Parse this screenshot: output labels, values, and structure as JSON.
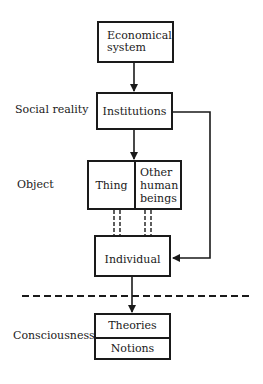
{
  "diagram": {
    "layers": {
      "social_reality": "Social reality",
      "object": "Object",
      "consciousness": "Consciousness"
    },
    "nodes": {
      "economical_system": [
        "Economical",
        "system"
      ],
      "institutions": "Institutions",
      "thing": "Thing",
      "other_human_beings": [
        "Other",
        "human",
        "beings"
      ],
      "individual": "Individual",
      "theories": "Theories",
      "notions": "Notions"
    },
    "edges": [
      {
        "from": "Economical system",
        "to": "Institutions",
        "style": "solid-arrow"
      },
      {
        "from": "Institutions",
        "to": "Object (Thing / Other human beings)",
        "style": "solid-arrow"
      },
      {
        "from": "Institutions",
        "to": "Individual",
        "style": "solid-arrow-right-loop"
      },
      {
        "from": "Thing",
        "to": "Individual",
        "style": "double-dashed"
      },
      {
        "from": "Other human beings",
        "to": "Individual",
        "style": "double-dashed"
      },
      {
        "from": "Individual",
        "to": "Consciousness (Theories / Notions)",
        "style": "solid-arrow"
      }
    ],
    "separator": "dashed-horizontal-line",
    "colors": {
      "ink": "#1a1a1a",
      "background": "#ffffff"
    }
  }
}
